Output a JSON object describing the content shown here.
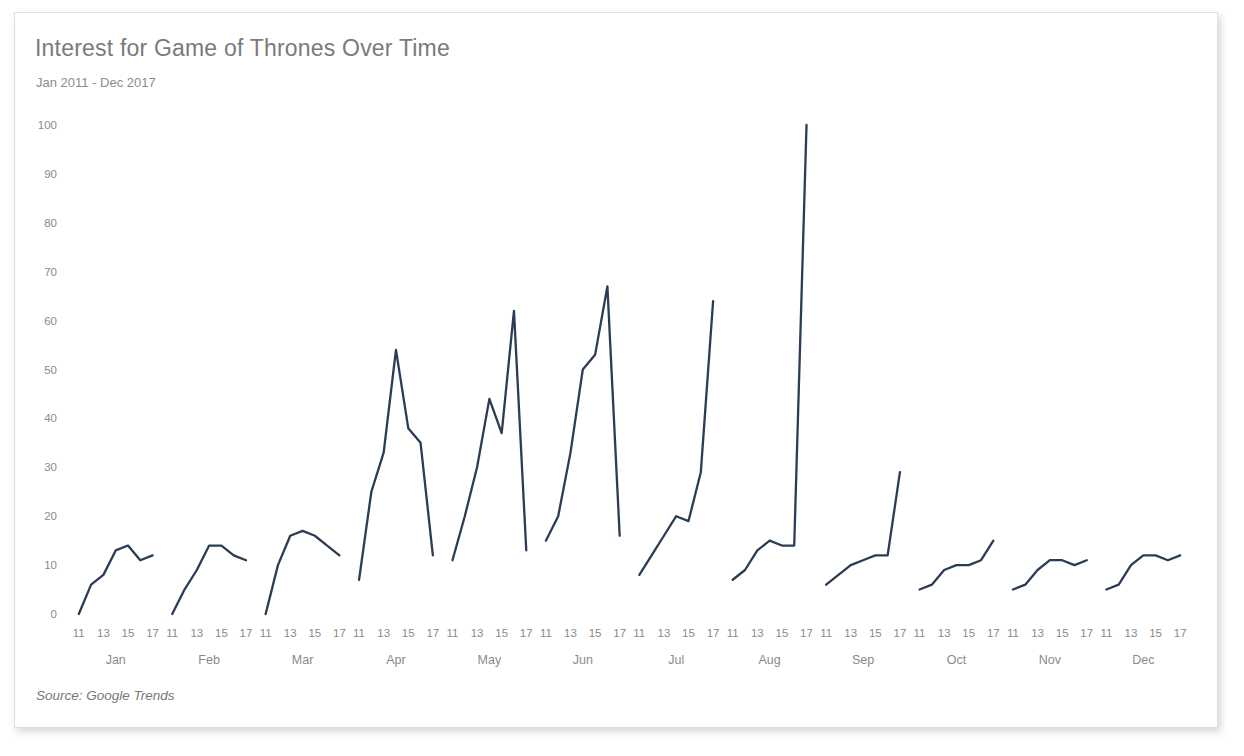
{
  "card": {
    "title": "Interest for Game of Thrones Over Time",
    "subtitle": "Jan 2011 - Dec 2017",
    "source": "Source: Google Trends"
  },
  "chart_data": {
    "type": "line",
    "title": "Interest for Game of Thrones Over Time",
    "subtitle": "Jan 2011 - Dec 2017",
    "xlabel": "",
    "ylabel": "",
    "ylim": [
      0,
      100
    ],
    "yticks": [
      0,
      10,
      20,
      30,
      40,
      50,
      60,
      70,
      80,
      90,
      100
    ],
    "grid": false,
    "legend": "none",
    "line_color": "#2b3c56",
    "x_group_labels": [
      "Jan",
      "Feb",
      "Mar",
      "Apr",
      "May",
      "Jun",
      "Jul",
      "Aug",
      "Sep",
      "Oct",
      "Nov",
      "Dec"
    ],
    "x_tick_labels": [
      "11",
      "13",
      "15",
      "17"
    ],
    "x_tick_years": [
      2011,
      2013,
      2015,
      2017
    ],
    "years": [
      2011,
      2012,
      2013,
      2014,
      2015,
      2016,
      2017
    ],
    "annotation": "Source: Google Trends",
    "series": [
      {
        "name": "Jan",
        "values": [
          0,
          6,
          8,
          13,
          14,
          11,
          12
        ]
      },
      {
        "name": "Feb",
        "values": [
          0,
          5,
          9,
          14,
          14,
          12,
          11
        ]
      },
      {
        "name": "Mar",
        "values": [
          0,
          10,
          16,
          17,
          16,
          14,
          12
        ]
      },
      {
        "name": "Apr",
        "values": [
          7,
          25,
          33,
          54,
          38,
          35,
          12
        ]
      },
      {
        "name": "May",
        "values": [
          11,
          20,
          30,
          44,
          37,
          62,
          13
        ]
      },
      {
        "name": "Jun",
        "values": [
          15,
          20,
          33,
          50,
          53,
          67,
          16
        ]
      },
      {
        "name": "Jul",
        "values": [
          8,
          12,
          16,
          20,
          19,
          29,
          64
        ]
      },
      {
        "name": "Aug",
        "values": [
          7,
          9,
          13,
          15,
          14,
          14,
          100
        ]
      },
      {
        "name": "Sep",
        "values": [
          6,
          8,
          10,
          11,
          12,
          12,
          29
        ]
      },
      {
        "name": "Oct",
        "values": [
          5,
          6,
          9,
          10,
          10,
          11,
          15
        ]
      },
      {
        "name": "Nov",
        "values": [
          5,
          6,
          9,
          11,
          11,
          10,
          11
        ]
      },
      {
        "name": "Dec",
        "values": [
          5,
          6,
          10,
          12,
          12,
          11,
          12
        ]
      }
    ]
  }
}
